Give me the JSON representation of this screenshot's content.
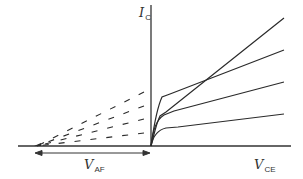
{
  "diagram": {
    "type": "BJT output characteristics with Early voltage extrapolation",
    "labels": {
      "y_axis": {
        "main": "I",
        "sub": "C"
      },
      "x_axis": {
        "main": "V",
        "sub": "CE"
      },
      "early_voltage": {
        "main": "V",
        "sub": "AF"
      }
    },
    "colors": {
      "line": "#2a2a2a",
      "axis": "#333333",
      "text": "#333333",
      "background": "#ffffff"
    },
    "curves_count": 4,
    "extrapolation_style": "dashed"
  }
}
